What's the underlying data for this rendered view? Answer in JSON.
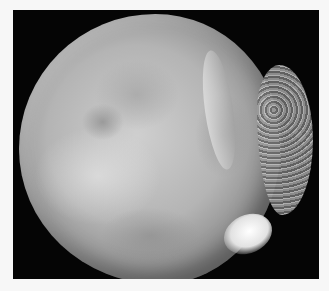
{
  "image": {
    "subject": "gross specimen, cut surface of rounded tissue mass",
    "palette": {
      "background": "#f7f7f7",
      "photo_backdrop": "#050505",
      "specimen_light": "#cfcfcf",
      "specimen_mid": "#b4b4b4",
      "specimen_dark": "#8a8a8a"
    }
  }
}
